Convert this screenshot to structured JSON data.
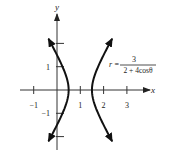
{
  "chart_data": {
    "type": "line",
    "title": "",
    "xlabel": "x",
    "ylabel": "y",
    "xlim": [
      -1.6,
      4.0
    ],
    "ylim": [
      -2.6,
      3.3
    ],
    "x_ticks": [
      {
        "value": -1,
        "label": "−1"
      },
      {
        "value": 1,
        "label": "1"
      },
      {
        "value": 2,
        "label": "2"
      },
      {
        "value": 3,
        "label": "3"
      }
    ],
    "y_ticks": [
      {
        "value": 2,
        "label": ""
      },
      {
        "value": 1,
        "label": "1"
      },
      {
        "value": -1,
        "label": "−1"
      },
      {
        "value": -2,
        "label": ""
      }
    ],
    "grid": false,
    "equation": {
      "lhs": "r =",
      "numerator": "3",
      "denominator": "2 + 4cosθ"
    },
    "series": [
      {
        "name": "hyperbola-left-branch",
        "description": "r = 3/(2+4cosθ), vertex at (0.5, 0)",
        "center_x": 1,
        "a": 0.5,
        "b_squared": 0.75,
        "branch": "left",
        "y_range": [
          -2.2,
          2.2
        ]
      },
      {
        "name": "hyperbola-right-branch",
        "description": "r = 3/(2+4cosθ), vertex at (1.5, 0)",
        "center_x": 1,
        "a": 0.5,
        "b_squared": 0.75,
        "branch": "right",
        "y_range": [
          -2.2,
          2.2
        ]
      }
    ]
  }
}
